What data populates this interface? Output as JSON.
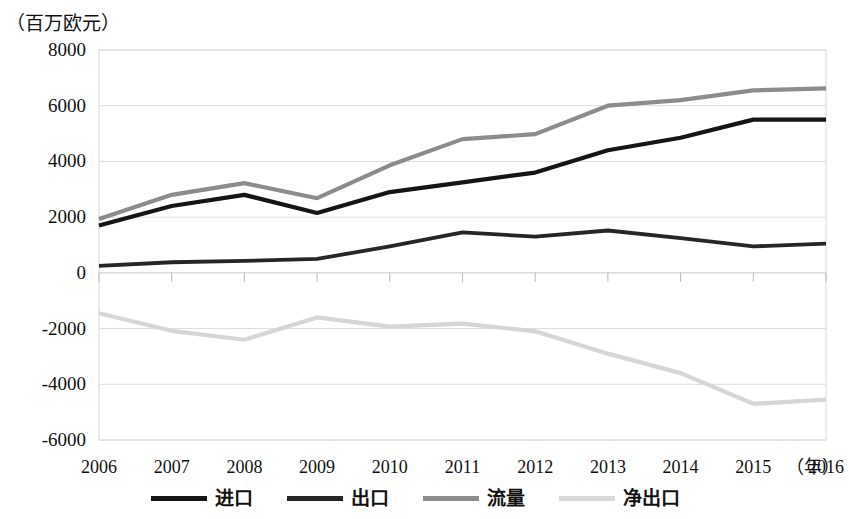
{
  "chart_data": {
    "type": "line",
    "title": "（百万欧元）",
    "xlabel": "（年）",
    "ylabel": "",
    "categories": [
      "2006",
      "2007",
      "2008",
      "2009",
      "2010",
      "2011",
      "2012",
      "2013",
      "2014",
      "2015",
      "2016"
    ],
    "ylim": [
      -6000,
      8000
    ],
    "ytick_step": 2000,
    "yticks": [
      "8000",
      "6000",
      "4000",
      "2000",
      "0",
      "-2000",
      "-4000",
      "-6000"
    ],
    "grid": true,
    "legend_position": "bottom",
    "series": [
      {
        "name": "进口",
        "color": "#151515",
        "width": 4.2,
        "values": [
          1700,
          2400,
          2800,
          2150,
          2900,
          3250,
          3600,
          4400,
          4850,
          5500,
          5500
        ]
      },
      {
        "name": "出口",
        "color": "#262626",
        "width": 3.8,
        "values": [
          250,
          380,
          430,
          500,
          950,
          1450,
          1300,
          1520,
          1250,
          950,
          1050
        ]
      },
      {
        "name": "流量",
        "color": "#8c8c8c",
        "width": 4.2,
        "values": [
          1930,
          2800,
          3220,
          2680,
          3860,
          4800,
          4980,
          6000,
          6200,
          6550,
          6620
        ]
      },
      {
        "name": "净出口",
        "color": "#d6d6d6",
        "width": 4.2,
        "values": [
          -1450,
          -2080,
          -2400,
          -1600,
          -1930,
          -1820,
          -2100,
          -2900,
          -3600,
          -4700,
          -4550
        ]
      }
    ]
  },
  "legend": {
    "items": [
      {
        "label": "进口",
        "color": "#151515",
        "width": 5
      },
      {
        "label": "出口",
        "color": "#262626",
        "width": 5
      },
      {
        "label": "流量",
        "color": "#8c8c8c",
        "width": 5
      },
      {
        "label": "净出口",
        "color": "#d9d9d9",
        "width": 5
      }
    ]
  },
  "axes": {
    "y_title": "（百万欧元）",
    "x_unit": "（年）"
  }
}
